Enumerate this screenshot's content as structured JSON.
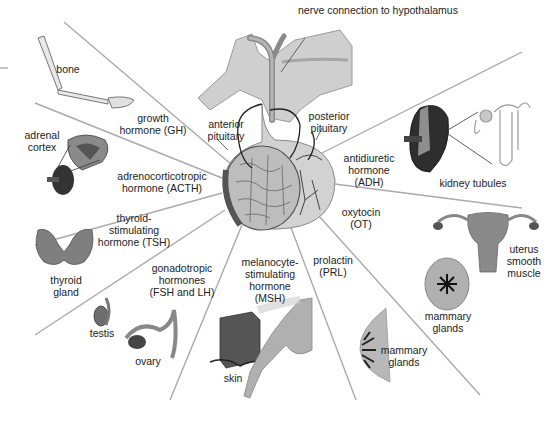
{
  "diagram": {
    "center": {
      "nerve_label": "nerve connection to hypothalamus",
      "anterior_label": "anterior\npituitary",
      "posterior_label": "posterior\npituitary"
    },
    "hormones": [
      {
        "id": "gh",
        "label": "growth\nhormone (GH)",
        "target": "bone"
      },
      {
        "id": "acth",
        "label": "adrenocorticotropic\nhormone (ACTH)",
        "target": "adrenal\ncortex"
      },
      {
        "id": "tsh",
        "label": "thyroid-\nstimulating\nhormone (TSH)",
        "target": "thyroid\ngland"
      },
      {
        "id": "fsh_lh",
        "label": "gonadotropic\nhormones\n(FSH and LH)",
        "target_1": "testis",
        "target_2": "ovary"
      },
      {
        "id": "msh",
        "label": "melanocyte-\nstimulating\nhormone\n(MSH)",
        "target": "skin"
      },
      {
        "id": "prl",
        "label": "prolactin\n(PRL)",
        "target": "mammary\nglands"
      },
      {
        "id": "ot",
        "label": "oxytocin\n(OT)",
        "target_1": "uterus\nsmooth\nmuscle",
        "target_2": "mammary\nglands"
      },
      {
        "id": "adh",
        "label": "antidiuretic\nhormone\n(ADH)",
        "target": "kidney tubules"
      }
    ],
    "colors": {
      "line": "#a8a8a8",
      "tissue_light": "#c9c9c9",
      "tissue_mid": "#9a9a9a",
      "tissue_dark": "#3a3a3a",
      "text": "#222222"
    }
  }
}
